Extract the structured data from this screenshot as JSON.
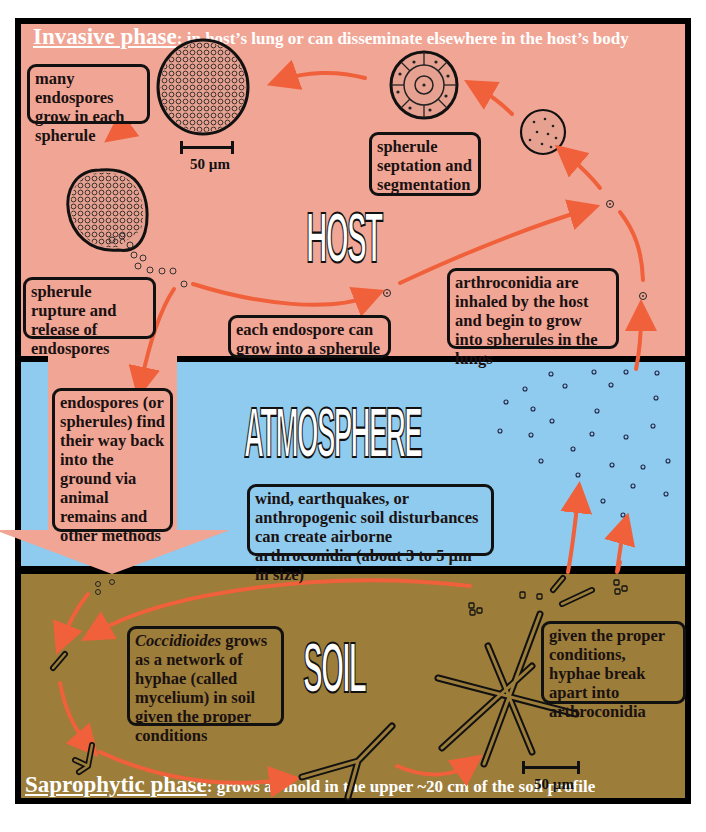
{
  "colors": {
    "host_bg": "#f1a595",
    "atmosphere_bg": "#8ecbee",
    "soil_bg": "#9c7d3a",
    "arrow": "#f0603a",
    "frame": "#000000"
  },
  "zones": {
    "host": {
      "label": "HOST",
      "phase_key": "Invasive phase",
      "phase_rest": ": in host’s lung or can disseminate elsewhere in the host’s body"
    },
    "atmosphere": {
      "label": "ATMOSPHERE"
    },
    "soil": {
      "label": "SOIL",
      "phase_key": "Saprophytic phase",
      "phase_rest": ": grows as mold in the upper ~20 cm of the soil profile"
    }
  },
  "boxes": {
    "endospores_grow": "many endospores grow in each spherule",
    "septation": "spherule septation and segmentation",
    "rupture": "spherule rupture and release of endospores",
    "each_endospore": "each endospore can grow into a spherule",
    "inhaled": "arthroconidia are inhaled by the host and begin to grow into spherules in the lungs",
    "back_to_ground": "endospores (or spherules) find their way back into the ground via animal remains and other methods",
    "wind": "wind, earthquakes, or anthropogenic soil disturbances can create airborne arthroconidia (about 3 to 5 µm in size)",
    "mycelium_italic": "Coccidioides",
    "mycelium_rest": " grows as a network of hyphae (called mycelium) in soil given the proper conditions",
    "break_apart": "given the proper conditions, hyphae break apart into arthroconidia"
  },
  "scale_bars": {
    "host": "50 µm",
    "soil": "50 µm"
  }
}
